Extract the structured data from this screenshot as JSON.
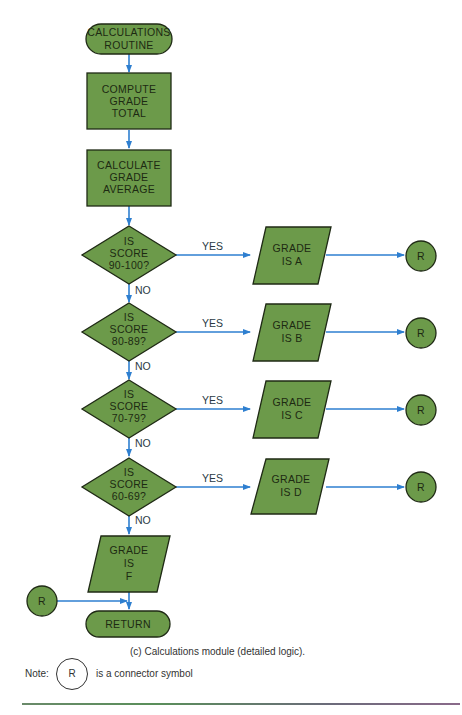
{
  "colors": {
    "shape_fill": "#6c9a4a",
    "shape_stroke": "#1f2a15",
    "arrow": "#2e7fd0",
    "text": "#1d2a12"
  },
  "nodes": {
    "start": {
      "type": "terminal",
      "lines": [
        "CALCULATIONS",
        "ROUTINE"
      ]
    },
    "compute_total": {
      "type": "process",
      "lines": [
        "COMPUTE",
        "GRADE",
        "TOTAL"
      ]
    },
    "calculate_average": {
      "type": "process",
      "lines": [
        "CALCULATE",
        "GRADE",
        "AVERAGE"
      ]
    },
    "decisions": [
      {
        "lines": [
          "IS",
          "SCORE",
          "90-100?"
        ],
        "yes_output": [
          "GRADE",
          "IS A"
        ],
        "connector": "R"
      },
      {
        "lines": [
          "IS",
          "SCORE",
          "80-89?"
        ],
        "yes_output": [
          "GRADE",
          "IS B"
        ],
        "connector": "R"
      },
      {
        "lines": [
          "IS",
          "SCORE",
          "70-79?"
        ],
        "yes_output": [
          "GRADE",
          "IS C"
        ],
        "connector": "R"
      },
      {
        "lines": [
          "IS",
          "SCORE",
          "60-69?"
        ],
        "yes_output": [
          "GRADE",
          "IS D"
        ],
        "connector": "R"
      }
    ],
    "grade_f": {
      "type": "io",
      "lines": [
        "GRADE",
        "IS",
        "F"
      ]
    },
    "entry_connector": {
      "type": "connector",
      "label": "R"
    },
    "end": {
      "type": "terminal",
      "lines": [
        "RETURN"
      ]
    }
  },
  "edge_labels": {
    "yes": "YES",
    "no": "NO"
  },
  "caption": "(c)  Calculations module (detailed logic).",
  "note": {
    "prefix": "Note:",
    "symbol": "R",
    "suffix": "is a connector symbol"
  }
}
